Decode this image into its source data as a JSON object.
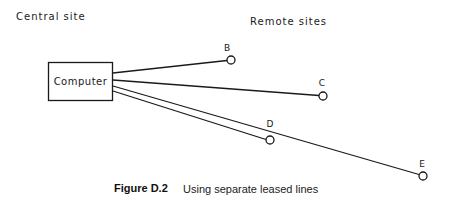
{
  "headers": {
    "central": "Central site",
    "remote": "Remote sites"
  },
  "computer": {
    "label": "Computer"
  },
  "sites": [
    {
      "id": "B",
      "label": "B"
    },
    {
      "id": "C",
      "label": "C"
    },
    {
      "id": "D",
      "label": "D"
    },
    {
      "id": "E",
      "label": "E"
    }
  ],
  "caption": {
    "number": "Figure D.2",
    "text": "Using separate leased lines"
  },
  "colors": {
    "ink": "#1a1a1a",
    "background": "#ffffff"
  }
}
